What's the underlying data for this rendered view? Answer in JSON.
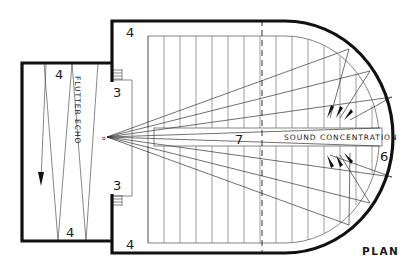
{
  "diagram": {
    "title": "PLAN",
    "colors": {
      "wall": "#111111",
      "line": "#555555",
      "background": "#ffffff"
    },
    "labels": {
      "flutter_echo": "FLUTTER ECHO",
      "sound_concentration": "SOUND CONCENTRATION",
      "stage_top_left": "4",
      "stage_bottom_left": "4",
      "hall_top_left": "4",
      "hall_bottom_left": "4",
      "door_top": "3",
      "door_bottom": "3",
      "aisle": "7",
      "rear_wall": "6",
      "source": "o"
    },
    "phenomena": [
      {
        "name": "Flutter echo",
        "location": "stage",
        "marker": "4"
      },
      {
        "name": "Sound concentration",
        "location": "curved rear wall",
        "marker": "6"
      }
    ]
  }
}
